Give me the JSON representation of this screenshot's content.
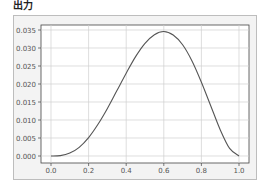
{
  "header": {
    "title": "出力"
  },
  "chart_data": {
    "type": "line",
    "title": "",
    "xlabel": "",
    "ylabel": "",
    "xlim": [
      -0.05,
      1.05
    ],
    "ylim": [
      -0.0017,
      0.0363
    ],
    "grid": true,
    "x_ticks": [
      "0.0",
      "0.2",
      "0.4",
      "0.6",
      "0.8",
      "1.0"
    ],
    "y_ticks": [
      "0.000",
      "0.005",
      "0.010",
      "0.015",
      "0.020",
      "0.025",
      "0.030",
      "0.035"
    ],
    "series": [
      {
        "name": "curve",
        "color": "#555555",
        "x": [
          0.0,
          0.05,
          0.1,
          0.15,
          0.2,
          0.25,
          0.3,
          0.35,
          0.4,
          0.45,
          0.5,
          0.55,
          0.6,
          0.65,
          0.7,
          0.75,
          0.8,
          0.85,
          0.9,
          0.95,
          1.0
        ],
        "y": [
          0.0,
          0.0001,
          0.0008,
          0.0024,
          0.0051,
          0.0088,
          0.0132,
          0.0181,
          0.023,
          0.0276,
          0.0313,
          0.0337,
          0.0346,
          0.0336,
          0.0309,
          0.0264,
          0.0205,
          0.0139,
          0.0073,
          0.0021,
          0.0
        ]
      }
    ]
  }
}
